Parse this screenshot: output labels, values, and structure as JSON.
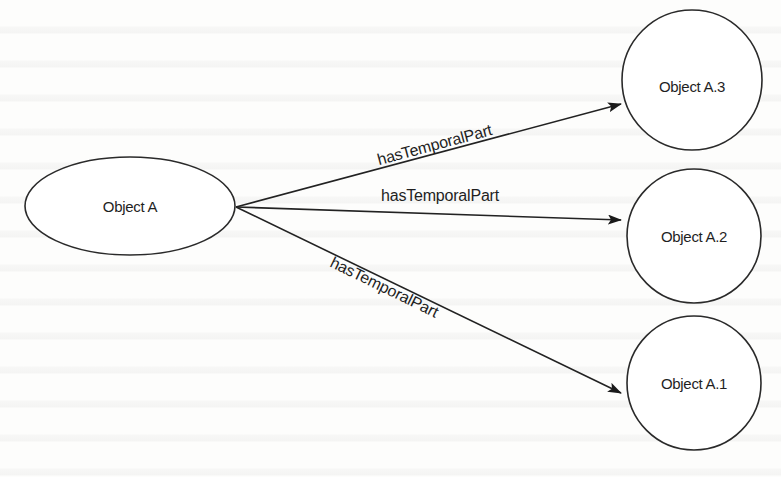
{
  "diagram": {
    "type": "directed-graph",
    "colors": {
      "background": "#fdfdfc",
      "stroke": "#2a2a2a",
      "text": "#1f1f1f"
    },
    "nodes": [
      {
        "id": "A",
        "label": "Object A",
        "shape": "ellipse"
      },
      {
        "id": "A3",
        "label": "Object A.3",
        "shape": "circle"
      },
      {
        "id": "A2",
        "label": "Object A.2",
        "shape": "circle"
      },
      {
        "id": "A1",
        "label": "Object A.1",
        "shape": "circle"
      }
    ],
    "edges": [
      {
        "from": "A",
        "to": "A3",
        "label": "hasTemporalPart"
      },
      {
        "from": "A",
        "to": "A2",
        "label": "hasTemporalPart"
      },
      {
        "from": "A",
        "to": "A1",
        "label": "hasTemporalPart"
      }
    ]
  }
}
